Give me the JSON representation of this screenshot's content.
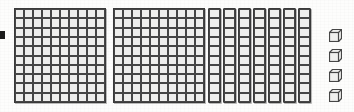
{
  "image": {
    "title": "Base-ten blocks representation",
    "kind": "base-ten-blocks-diagram",
    "background_color": "#fdfdfc",
    "block_line_color": "#464646",
    "block_fill_color": "#efefed",
    "edge_mark_color": "#1b1b1b"
  },
  "blocks": {
    "flats": {
      "label": "hundreds flat",
      "count": 2,
      "rows": 10,
      "columns": 10,
      "unit_value": 100,
      "positions_x": [
        14,
        113
      ],
      "top": 8,
      "width": 92,
      "height": 95
    },
    "rods": {
      "label": "tens rod",
      "count": 7,
      "rows": 10,
      "columns": 1,
      "unit_value": 10,
      "positions_x": [
        208,
        223,
        238,
        253,
        268,
        283,
        298
      ],
      "top": 8,
      "width": 13,
      "height": 95
    },
    "units": {
      "label": "ones cube",
      "count": 4,
      "unit_value": 1,
      "position_x": 329,
      "positions_y": [
        29,
        49,
        69,
        89
      ],
      "size": 13
    }
  },
  "value": {
    "hundreds": 2,
    "tens": 7,
    "ones": 4,
    "total": 274
  }
}
